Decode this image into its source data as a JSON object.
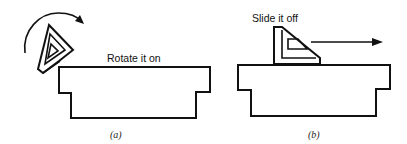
{
  "figure": {
    "panels": [
      {
        "id": "a",
        "caption": "(a)",
        "annotation": "Rotate it on",
        "action": "rotate"
      },
      {
        "id": "b",
        "caption": "(b)",
        "annotation": "Slide it off",
        "action": "slide"
      }
    ]
  },
  "colors": {
    "line": "#111111",
    "background": "#ffffff"
  }
}
